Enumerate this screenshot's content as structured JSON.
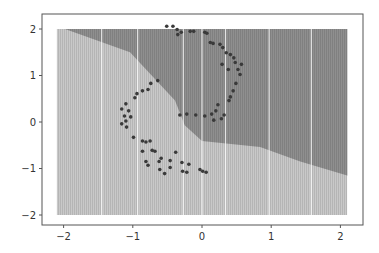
{
  "chart_data": {
    "type": "scatter",
    "subtype": "decision-boundary",
    "title": "",
    "xlabel": "",
    "ylabel": "",
    "xlim": [
      -2.3,
      2.3
    ],
    "ylim": [
      -2.3,
      2.3
    ],
    "grid": false,
    "legend": null,
    "x_ticks": [
      -2,
      -1,
      0,
      1,
      2
    ],
    "y_ticks": [
      -2,
      -1,
      0,
      1,
      2
    ],
    "x_tick_labels": [
      "−2",
      "−1",
      "0",
      "1",
      "2"
    ],
    "y_tick_labels": [
      "−2",
      "−1",
      "0",
      "1",
      "2"
    ],
    "mesh_extent": {
      "x": [
        -2.1,
        2.1
      ],
      "y": [
        -2.0,
        2.0
      ]
    },
    "regions": [
      {
        "name": "class-0 region (light)",
        "color": "#c9c9c9"
      },
      {
        "name": "class-1 region (dark)",
        "color": "#8f8f8f"
      }
    ],
    "decision_boundary": [
      [
        -1.98,
        2.0
      ],
      [
        -1.04,
        1.5
      ],
      [
        -0.39,
        0.46
      ],
      [
        -0.25,
        -0.07
      ],
      [
        0.0,
        -0.41
      ],
      [
        0.84,
        -0.54
      ],
      [
        1.42,
        -0.85
      ],
      [
        2.12,
        -1.16
      ]
    ],
    "points": [
      [
        -0.51,
        2.06
      ],
      [
        -0.42,
        2.06
      ],
      [
        -0.36,
        1.99
      ],
      [
        -0.35,
        1.88
      ],
      [
        -0.3,
        1.93
      ],
      [
        -0.17,
        1.95
      ],
      [
        -0.12,
        1.95
      ],
      [
        0.04,
        1.93
      ],
      [
        0.07,
        1.91
      ],
      [
        0.12,
        1.71
      ],
      [
        0.16,
        1.69
      ],
      [
        0.26,
        1.67
      ],
      [
        0.3,
        1.6
      ],
      [
        0.35,
        1.49
      ],
      [
        0.41,
        1.45
      ],
      [
        0.46,
        1.38
      ],
      [
        0.48,
        1.28
      ],
      [
        0.57,
        1.24
      ],
      [
        0.52,
        1.13
      ],
      [
        0.55,
        1.02
      ],
      [
        0.29,
        1.24
      ],
      [
        0.38,
        1.13
      ],
      [
        0.49,
        0.83
      ],
      [
        0.45,
        0.67
      ],
      [
        0.41,
        0.54
      ],
      [
        0.39,
        0.46
      ],
      [
        0.23,
        0.37
      ],
      [
        0.2,
        0.24
      ],
      [
        0.14,
        0.17
      ],
      [
        0.04,
        0.13
      ],
      [
        -0.09,
        0.15
      ],
      [
        -0.22,
        0.17
      ],
      [
        -0.32,
        0.15
      ],
      [
        0.32,
        0.15
      ],
      [
        0.28,
        0.07
      ],
      [
        0.17,
        0.04
      ],
      [
        -0.64,
        0.89
      ],
      [
        -0.74,
        0.83
      ],
      [
        -0.78,
        0.7
      ],
      [
        -0.86,
        0.67
      ],
      [
        -0.94,
        0.61
      ],
      [
        -0.97,
        0.52
      ],
      [
        -1.1,
        0.39
      ],
      [
        -1.16,
        0.28
      ],
      [
        -1.06,
        0.24
      ],
      [
        -1.12,
        0.13
      ],
      [
        -1.03,
        0.11
      ],
      [
        -1.1,
        0.02
      ],
      [
        -1.16,
        -0.04
      ],
      [
        -1.09,
        -0.11
      ],
      [
        -0.99,
        -0.33
      ],
      [
        -0.86,
        -0.41
      ],
      [
        -0.81,
        -0.43
      ],
      [
        -0.75,
        -0.41
      ],
      [
        -0.72,
        -0.61
      ],
      [
        -0.86,
        -0.63
      ],
      [
        -0.68,
        -0.63
      ],
      [
        -0.62,
        -0.85
      ],
      [
        -0.59,
        -0.78
      ],
      [
        -0.46,
        -0.83
      ],
      [
        -0.29,
        -0.87
      ],
      [
        -0.81,
        -0.85
      ],
      [
        -0.78,
        -0.93
      ],
      [
        -0.46,
        -0.98
      ],
      [
        -0.28,
        -1.06
      ],
      [
        -0.61,
        -1.02
      ],
      [
        -0.54,
        -1.11
      ],
      [
        -0.22,
        -1.08
      ],
      [
        -0.03,
        -1.02
      ],
      [
        0.01,
        -1.06
      ],
      [
        0.06,
        -1.08
      ],
      [
        -0.19,
        -0.91
      ],
      [
        -0.38,
        -0.65
      ]
    ],
    "point_color": "#3a3a3a"
  }
}
